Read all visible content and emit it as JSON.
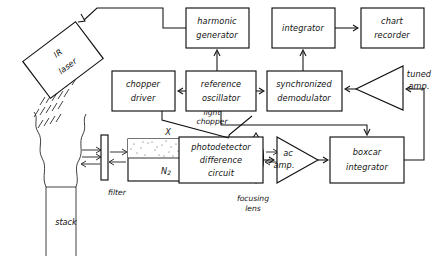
{
  "figure": {
    "type": "block-diagram",
    "line_color": "#111111",
    "background": "#ffffff"
  },
  "blocks": [
    {
      "id": "ir_laser",
      "label_line1": "IR",
      "label_line2": "laser",
      "shape": "rotated-rectangle"
    },
    {
      "id": "harmonic_gen",
      "label_line1": "harmonic",
      "label_line2": "generator",
      "shape": "rectangle"
    },
    {
      "id": "integrator",
      "label_line1": "integrator",
      "label_line2": "",
      "shape": "rectangle"
    },
    {
      "id": "chart_recorder",
      "label_line1": "chart",
      "label_line2": "recorder",
      "shape": "rectangle"
    },
    {
      "id": "chopper_driver",
      "label_line1": "chopper",
      "label_line2": "driver",
      "shape": "rectangle"
    },
    {
      "id": "ref_oscillator",
      "label_line1": "reference",
      "label_line2": "oscillator",
      "shape": "rectangle"
    },
    {
      "id": "sync_demod",
      "label_line1": "synchronized",
      "label_line2": "demodulator",
      "shape": "rectangle"
    },
    {
      "id": "tuned_amp",
      "label_line1": "tuned",
      "label_line2": "amp.",
      "shape": "triangle-left"
    },
    {
      "id": "photodetector",
      "label_line1": "photodetector",
      "label_line2": "difference",
      "label_line3": "circuit",
      "shape": "rectangle"
    },
    {
      "id": "ac_amp",
      "label_line1": "ac",
      "label_line2": "amp.",
      "shape": "triangle-right"
    },
    {
      "id": "boxcar",
      "label_line1": "boxcar",
      "label_line2": "integrator",
      "shape": "rectangle"
    }
  ],
  "optical_labels": {
    "stack": "stack",
    "filter": "filter",
    "cell_top": "X",
    "cell_bottom": "N",
    "cell_bottom_sub": "2",
    "light_chopper_line1": "light",
    "light_chopper_line2": "chopper",
    "focusing_lens_line1": "focusing",
    "focusing_lens_line2": "lens"
  }
}
